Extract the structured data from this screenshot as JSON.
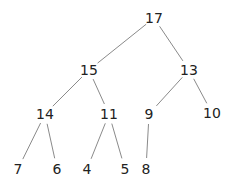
{
  "diagram": {
    "type": "binary-tree",
    "nodes": [
      {
        "id": "n17",
        "label": "17",
        "parent": null
      },
      {
        "id": "n15",
        "label": "15",
        "parent": "n17"
      },
      {
        "id": "n13",
        "label": "13",
        "parent": "n17"
      },
      {
        "id": "n14",
        "label": "14",
        "parent": "n15"
      },
      {
        "id": "n11",
        "label": "11",
        "parent": "n15"
      },
      {
        "id": "n9",
        "label": "9",
        "parent": "n13"
      },
      {
        "id": "n10",
        "label": "10",
        "parent": "n13"
      },
      {
        "id": "n7",
        "label": "7",
        "parent": "n14"
      },
      {
        "id": "n6",
        "label": "6",
        "parent": "n14"
      },
      {
        "id": "n4",
        "label": "4",
        "parent": "n11"
      },
      {
        "id": "n5",
        "label": "5",
        "parent": "n11"
      },
      {
        "id": "n8",
        "label": "8",
        "parent": "n9"
      }
    ]
  }
}
